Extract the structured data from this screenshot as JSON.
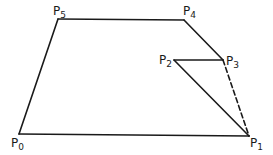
{
  "diagram": {
    "type": "polygon",
    "stroke_color": "#1a1a1a",
    "background": "#ffffff",
    "vertices": [
      {
        "id": "P0",
        "base": "P",
        "sub": "0",
        "x": 19,
        "y": 134,
        "lx": 11,
        "ly": 147
      },
      {
        "id": "P1",
        "base": "P",
        "sub": "1",
        "x": 249,
        "y": 136,
        "lx": 250,
        "ly": 147
      },
      {
        "id": "P2",
        "base": "P",
        "sub": "2",
        "x": 174,
        "y": 60,
        "lx": 159,
        "ly": 64
      },
      {
        "id": "P3",
        "base": "P",
        "sub": "3",
        "x": 223,
        "y": 60,
        "lx": 226,
        "ly": 65
      },
      {
        "id": "P4",
        "base": "P",
        "sub": "4",
        "x": 184,
        "y": 20,
        "lx": 183,
        "ly": 15
      },
      {
        "id": "P5",
        "base": "P",
        "sub": "5",
        "x": 58,
        "y": 19,
        "lx": 53,
        "ly": 15
      }
    ],
    "edges": [
      {
        "from": "P0",
        "to": "P1",
        "style": "solid"
      },
      {
        "from": "P1",
        "to": "P2",
        "style": "solid"
      },
      {
        "from": "P2",
        "to": "P3",
        "style": "solid"
      },
      {
        "from": "P3",
        "to": "P4",
        "style": "solid"
      },
      {
        "from": "P4",
        "to": "P5",
        "style": "solid"
      },
      {
        "from": "P5",
        "to": "P0",
        "style": "solid"
      },
      {
        "from": "P3",
        "to": "P1",
        "style": "dashed"
      }
    ]
  }
}
